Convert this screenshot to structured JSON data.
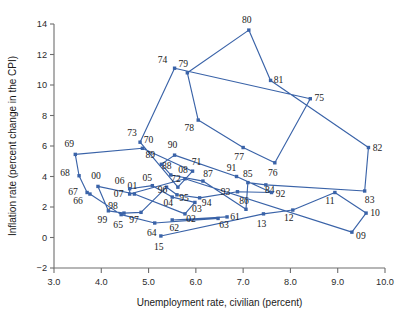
{
  "chart_data": {
    "type": "scatter",
    "title": "",
    "xlabel": "Unemployment rate, civilian (percent)",
    "ylabel": "Inflation rate (percent change in the CPI)",
    "xlim": [
      3.0,
      10.0
    ],
    "ylim": [
      -2,
      14
    ],
    "xticks": [
      "3.0",
      "4.0",
      "5.0",
      "6.0",
      "7.0",
      "8.0",
      "9.0",
      "10.0"
    ],
    "yticks": [
      "-2",
      "0",
      "2",
      "4",
      "6",
      "8",
      "10",
      "12",
      "14"
    ],
    "grid": false,
    "legend": "none",
    "connected": true,
    "series_color": "#3a63a8",
    "points": [
      {
        "label": "61",
        "x": 6.66,
        "y": 1.35
      },
      {
        "label": "62",
        "x": 5.5,
        "y": 1.15
      },
      {
        "label": "63",
        "x": 6.47,
        "y": 1.25
      },
      {
        "label": "64",
        "x": 5.13,
        "y": 0.95
      },
      {
        "label": "65",
        "x": 4.42,
        "y": 1.5
      },
      {
        "label": "66",
        "x": 3.76,
        "y": 2.85
      },
      {
        "label": "67",
        "x": 3.7,
        "y": 2.95
      },
      {
        "label": "68",
        "x": 3.53,
        "y": 4.05
      },
      {
        "label": "69",
        "x": 3.45,
        "y": 5.45
      },
      {
        "label": "70",
        "x": 4.87,
        "y": 5.85
      },
      {
        "label": "71",
        "x": 5.93,
        "y": 4.35
      },
      {
        "label": "72",
        "x": 5.62,
        "y": 3.3
      },
      {
        "label": "73",
        "x": 4.82,
        "y": 6.25
      },
      {
        "label": "74",
        "x": 5.55,
        "y": 11.1
      },
      {
        "label": "75",
        "x": 8.42,
        "y": 9.1
      },
      {
        "label": "76",
        "x": 7.67,
        "y": 4.9
      },
      {
        "label": "77",
        "x": 7.0,
        "y": 5.9
      },
      {
        "label": "78",
        "x": 6.05,
        "y": 7.7
      },
      {
        "label": "79",
        "x": 5.82,
        "y": 10.8
      },
      {
        "label": "80",
        "x": 7.12,
        "y": 13.6
      },
      {
        "label": "81",
        "x": 7.58,
        "y": 10.3
      },
      {
        "label": "82",
        "x": 9.65,
        "y": 5.9
      },
      {
        "label": "83",
        "x": 9.57,
        "y": 3.05
      },
      {
        "label": "84",
        "x": 7.48,
        "y": 3.45
      },
      {
        "label": "85",
        "x": 7.1,
        "y": 3.6
      },
      {
        "label": "86",
        "x": 7.06,
        "y": 1.85
      },
      {
        "label": "87",
        "x": 6.15,
        "y": 3.7
      },
      {
        "label": "88",
        "x": 5.47,
        "y": 4.1
      },
      {
        "label": "89",
        "x": 5.27,
        "y": 4.8
      },
      {
        "label": "90",
        "x": 5.55,
        "y": 5.4
      },
      {
        "label": "91",
        "x": 6.86,
        "y": 4.0
      },
      {
        "label": "92",
        "x": 7.6,
        "y": 2.95
      },
      {
        "label": "93",
        "x": 6.88,
        "y": 3.0
      },
      {
        "label": "94",
        "x": 6.08,
        "y": 2.6
      },
      {
        "label": "95",
        "x": 5.6,
        "y": 2.8
      },
      {
        "label": "96",
        "x": 5.38,
        "y": 3.3
      },
      {
        "label": "97",
        "x": 4.84,
        "y": 1.65
      },
      {
        "label": "98",
        "x": 4.48,
        "y": 1.6
      },
      {
        "label": "99",
        "x": 4.15,
        "y": 1.75
      },
      {
        "label": "00",
        "x": 3.93,
        "y": 3.35
      },
      {
        "label": "01",
        "x": 4.7,
        "y": 2.85
      },
      {
        "label": "02",
        "x": 5.77,
        "y": 1.55
      },
      {
        "label": "03",
        "x": 5.98,
        "y": 2.3
      },
      {
        "label": "04",
        "x": 5.5,
        "y": 2.65
      },
      {
        "label": "05",
        "x": 5.08,
        "y": 3.4
      },
      {
        "label": "06",
        "x": 4.6,
        "y": 3.2
      },
      {
        "label": "07",
        "x": 4.6,
        "y": 2.85
      },
      {
        "label": "08",
        "x": 5.77,
        "y": 3.85
      },
      {
        "label": "09",
        "x": 9.3,
        "y": 0.35
      },
      {
        "label": "10",
        "x": 9.6,
        "y": 1.6
      },
      {
        "label": "11",
        "x": 8.94,
        "y": 2.95
      },
      {
        "label": "12",
        "x": 8.05,
        "y": 1.8
      },
      {
        "label": "13",
        "x": 7.43,
        "y": 1.55
      },
      {
        "label": "15",
        "x": 5.26,
        "y": 0.1
      }
    ],
    "label_offsets": {
      "61": [
        8,
        3
      ],
      "62": [
        2,
        11
      ],
      "63": [
        6,
        10
      ],
      "64": [
        -3,
        13
      ],
      "65": [
        -3,
        13
      ],
      "66": [
        -12,
        10
      ],
      "67": [
        -14,
        2
      ],
      "68": [
        -14,
        0
      ],
      "69": [
        -6,
        -7
      ],
      "70": [
        6,
        -5
      ],
      "71": [
        4,
        -6
      ],
      "72": [
        -2,
        -5
      ],
      "73": [
        -8,
        -6
      ],
      "74": [
        -12,
        -5
      ],
      "75": [
        9,
        2
      ],
      "76": [
        -2,
        13
      ],
      "77": [
        -4,
        12
      ],
      "78": [
        -9,
        11
      ],
      "79": [
        -4,
        -6
      ],
      "80": [
        -2,
        -7
      ],
      "81": [
        8,
        3
      ],
      "82": [
        9,
        3
      ],
      "83": [
        5,
        12
      ],
      "84": [
        4,
        8
      ],
      "85": [
        0,
        -6
      ],
      "86": [
        -2,
        -5
      ],
      "87": [
        5,
        -4
      ],
      "88": [
        -4,
        -6
      ],
      "89": [
        -11,
        -6
      ],
      "90": [
        -2,
        -7
      ],
      "91": [
        -5,
        -6
      ],
      "92": [
        9,
        4
      ],
      "93": [
        -12,
        3
      ],
      "94": [
        7,
        8
      ],
      "95": [
        7,
        6
      ],
      "96": [
        -4,
        6
      ],
      "97": [
        -7,
        11
      ],
      "98": [
        -11,
        -4
      ],
      "99": [
        -6,
        12
      ],
      "00": [
        -2,
        -7
      ],
      "01": [
        -2,
        -5
      ],
      "02": [
        6,
        8
      ],
      "03": [
        2,
        10
      ],
      "04": [
        -4,
        9
      ],
      "05": [
        -5,
        -5
      ],
      "06": [
        -10,
        -5
      ],
      "07": [
        -11,
        3
      ],
      "08": [
        -2,
        -6
      ],
      "09": [
        9,
        7
      ],
      "10": [
        9,
        3
      ],
      "11": [
        -5,
        11
      ],
      "12": [
        -4,
        11
      ],
      "13": [
        -2,
        13
      ],
      "15": [
        -2,
        14
      ]
    }
  }
}
